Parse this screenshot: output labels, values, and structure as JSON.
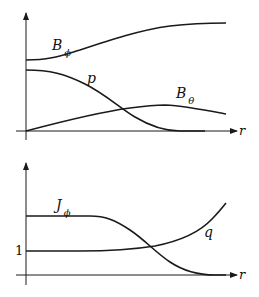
{
  "panels": [
    {
      "name": "top",
      "x_label": "r",
      "curves": [
        {
          "id": "B_phi",
          "label_main": "B",
          "label_sub": "ϕ",
          "description": "rises from moderate value to higher plateau"
        },
        {
          "id": "p",
          "label_main": "p",
          "label_sub": "",
          "description": "decreases from maximum to zero"
        },
        {
          "id": "B_theta",
          "label_main": "B",
          "label_sub": "θ",
          "description": "rises from zero, peaks, then slowly decreases"
        }
      ]
    },
    {
      "name": "bottom",
      "x_label": "r",
      "y_tick_label": "1",
      "curves": [
        {
          "id": "J_phi",
          "label_main": "J",
          "label_sub": "ϕ",
          "description": "flat then decreases to zero"
        },
        {
          "id": "q",
          "label_main": "q",
          "label_sub": "",
          "description": "starts at 1 and increases with r"
        }
      ]
    }
  ]
}
